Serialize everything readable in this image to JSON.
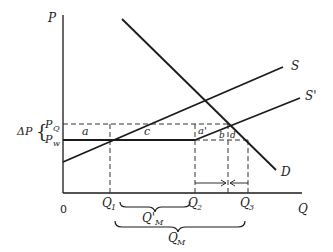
{
  "diagram": {
    "type": "supply-demand economics diagram",
    "axes": {
      "y_label": "P",
      "x_label": "Q",
      "origin_label": "0"
    },
    "curves": [
      {
        "name": "S",
        "label": "S"
      },
      {
        "name": "S'",
        "label": "S'"
      },
      {
        "name": "D",
        "label": "D"
      }
    ],
    "price_labels": {
      "delta_p": "ΔP",
      "p_q": "P",
      "p_q_sub": "Q",
      "p_w": "P",
      "p_w_sub": "w"
    },
    "quantity_labels": {
      "q1": "Q",
      "q1_sub": "1",
      "q2": "Q",
      "q2_sub": "2",
      "q3": "Q",
      "q3_sub": "3",
      "qm_prime": "Q'",
      "qm_prime_sub": "M",
      "qm": "Q",
      "qm_sub": "M"
    },
    "area_labels": {
      "a": "a",
      "c": "c",
      "a_prime": "a'",
      "b": "b",
      "d": "d"
    },
    "colors": {
      "line": "#1a1a1a",
      "background": "#ffffff"
    }
  }
}
